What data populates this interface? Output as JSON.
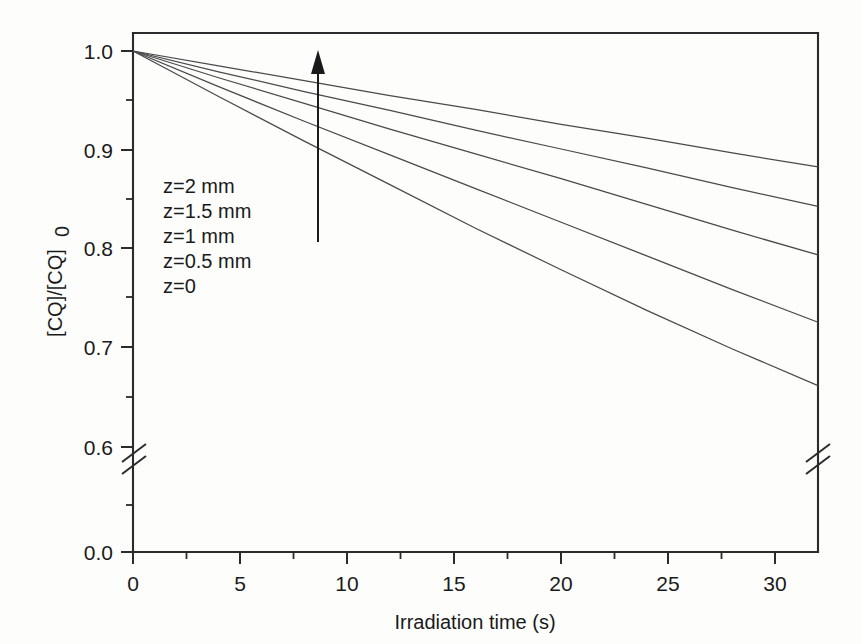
{
  "chart_data": {
    "type": "line",
    "title": "",
    "xlabel": "Irradiation time (s)",
    "ylabel": "[CQ]/[CQ]0",
    "ylabel_display": "[CQ]/[CQ]",
    "ylabel_subscript": "0",
    "xlim": [
      0,
      32
    ],
    "ylim_upper": [
      0.6,
      1.0
    ],
    "y_axis_broken": true,
    "y_break_between": [
      0.0,
      0.6
    ],
    "grid": false,
    "legend_position": "inside-left",
    "xticks": [
      0,
      5,
      10,
      15,
      20,
      25,
      30
    ],
    "xticklabels": [
      "0",
      "5",
      "10",
      "15",
      "20",
      "25",
      "30"
    ],
    "x_minor_ticks": [
      2.5,
      7.5,
      12.5,
      17.5,
      22.5,
      27.5
    ],
    "yticks": [
      0.0,
      0.6,
      0.7,
      0.8,
      0.9,
      1.0
    ],
    "yticklabels": [
      "0.0",
      "0.6",
      "0.7",
      "0.8",
      "0.9",
      "1.0"
    ],
    "y_minor_ticks": [
      0.65,
      0.75,
      0.85,
      0.95
    ],
    "x": [
      0,
      4,
      8,
      12,
      16,
      20,
      24,
      28,
      32
    ],
    "series": [
      {
        "name": "z=2 mm",
        "values": [
          1.0,
          0.985,
          0.97,
          0.955,
          0.941,
          0.926,
          0.912,
          0.897,
          0.883
        ]
      },
      {
        "name": "z=1.5 mm",
        "values": [
          1.0,
          0.979,
          0.959,
          0.94,
          0.92,
          0.901,
          0.882,
          0.862,
          0.843
        ]
      },
      {
        "name": "z=1 mm",
        "values": [
          1.0,
          0.973,
          0.947,
          0.921,
          0.896,
          0.871,
          0.845,
          0.819,
          0.794
        ]
      },
      {
        "name": "z=0.5 mm",
        "values": [
          1.0,
          0.964,
          0.929,
          0.895,
          0.861,
          0.827,
          0.793,
          0.759,
          0.726
        ]
      },
      {
        "name": "z=0",
        "values": [
          1.0,
          0.954,
          0.909,
          0.865,
          0.821,
          0.779,
          0.738,
          0.699,
          0.662
        ]
      }
    ],
    "annotations": [
      {
        "type": "arrow",
        "direction": "up",
        "meaning": "increasing depth z"
      }
    ]
  },
  "legend": {
    "items": [
      {
        "label": "z=2 mm"
      },
      {
        "label": "z=1.5 mm"
      },
      {
        "label": "z=1 mm"
      },
      {
        "label": "z=0.5 mm"
      },
      {
        "label": "z=0"
      }
    ]
  },
  "axes": {
    "x_title": "Irradiation time (s)",
    "y_title_main": "[CQ]/[CQ]",
    "y_title_sub": "0",
    "x_tick_labels": [
      "0",
      "5",
      "10",
      "15",
      "20",
      "25",
      "30"
    ],
    "y_tick_labels": [
      "1.0",
      "0.9",
      "0.8",
      "0.7",
      "0.6",
      "0.0"
    ]
  },
  "colors": {
    "axis": "#2b2b2b",
    "curve": "#4a4a4a",
    "text": "#1a1a1a",
    "background": "#fdfdfc"
  }
}
